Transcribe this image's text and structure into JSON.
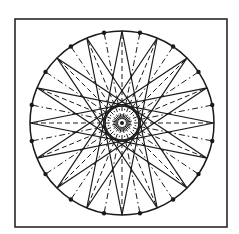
{
  "figure": {
    "frame": {
      "x": 15,
      "y": 19,
      "width": 212,
      "height": 208
    },
    "circle": {
      "cx": 122,
      "cy": 123,
      "r": 92
    },
    "inner_circle": {
      "r": 17
    },
    "star": {
      "points": 16,
      "step": 7
    },
    "colors": {
      "line": "#1a1a1a",
      "background": "#ffffff"
    }
  }
}
